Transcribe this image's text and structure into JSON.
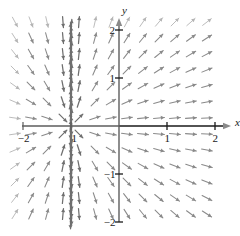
{
  "figure": {
    "kind": "direction-field",
    "background": "#ffffff",
    "arrow_color": "#8a8a8a",
    "axis_color": "#1a1a1a"
  },
  "axes": {
    "x_label": "x",
    "y_label": "y",
    "x_ticks": [
      {
        "value": -2,
        "label": "−2"
      },
      {
        "value": -1,
        "label": "1"
      },
      {
        "value": 1,
        "label": "1"
      },
      {
        "value": 2,
        "label": "2"
      }
    ],
    "y_ticks": [
      {
        "value": 2,
        "label": "2"
      },
      {
        "value": 1,
        "label": "1"
      },
      {
        "value": -1,
        "label": "−1"
      },
      {
        "value": -2,
        "label": "−2"
      }
    ]
  },
  "chart_data": {
    "type": "scatter",
    "title": "",
    "xlabel": "x",
    "ylabel": "y",
    "xlim": [
      -2.25,
      2.25
    ],
    "ylim": [
      -2.25,
      2.25
    ],
    "grid": false,
    "legend": null,
    "field": {
      "description": "slope field with vertical asymptote at x = -1",
      "slope_formula": "dy/dx = y / (x + 1)",
      "singularity_x": -1,
      "grid_step": 0.3333,
      "x_start": -2.1667,
      "x_end": 2.1667,
      "y_start": -2.1667,
      "y_end": 2.1667,
      "arrow_length_px": 11,
      "notes": "arrows flow away from the x-axis to the right of x=-1 and are mirrored (pointing leftward) to the left of x=-1; arrows become near-vertical adjacent to x=-1 and near-horizontal adjacent to y=0"
    }
  },
  "geometry": {
    "origin_px": {
      "x": 119,
      "y": 126
    },
    "unit_px": 48,
    "x_axis_pixel_span": [
      22,
      216
    ],
    "y_axis_pixel_span": [
      28,
      222
    ]
  }
}
